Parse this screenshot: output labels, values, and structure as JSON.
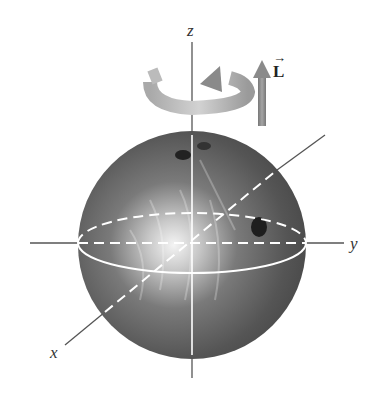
{
  "diagram": {
    "axes": {
      "x_label": "x",
      "y_label": "y",
      "z_label": "z"
    },
    "vector": {
      "label": "L",
      "arrow_over": "→"
    },
    "colors": {
      "ball_dark": "#4a4a4a",
      "ball_light": "#f2f2f2",
      "axis": "#555555",
      "equator": "#ffffff",
      "ring": "#b5b5b5",
      "arrow": "#8a8a8a"
    }
  }
}
